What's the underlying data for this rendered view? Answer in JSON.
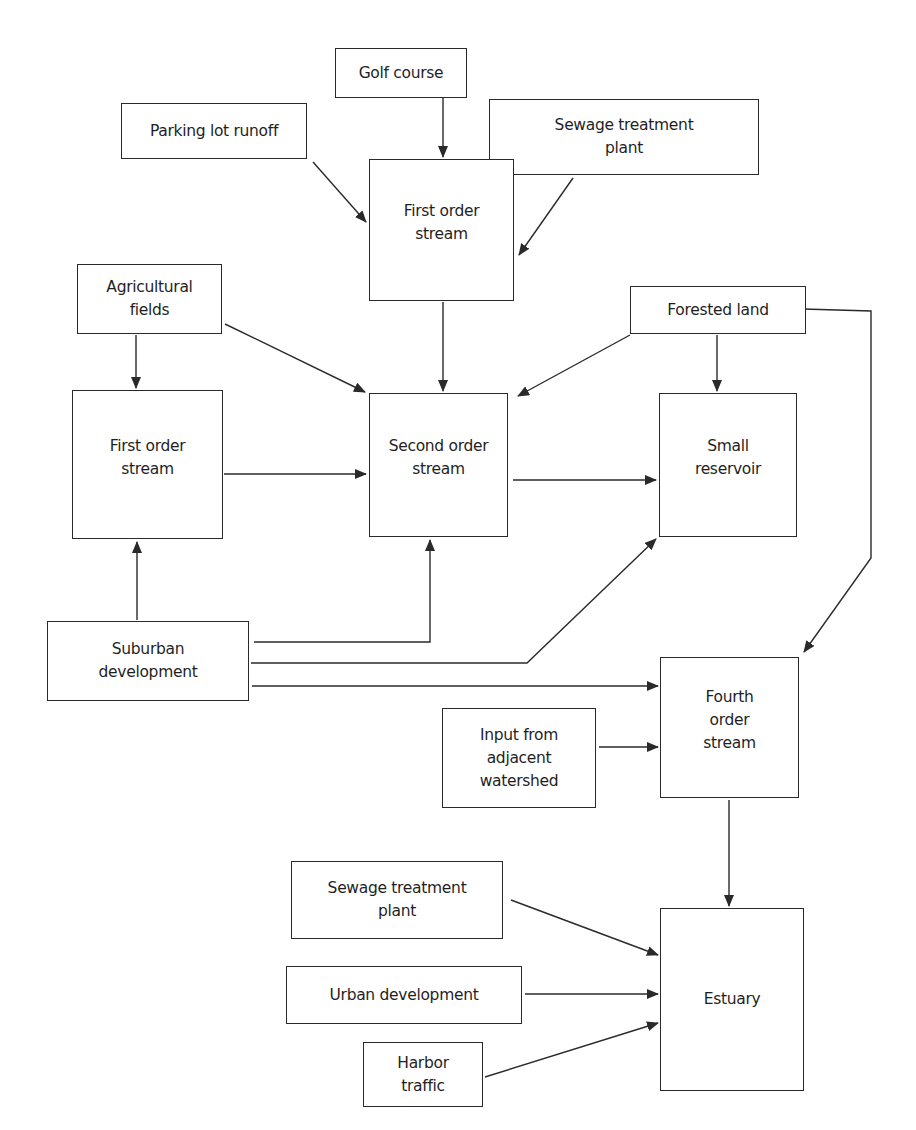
{
  "diagram": {
    "type": "flowchart",
    "nodes": {
      "golf_course": "Golf course",
      "parking_lot_runoff": "Parking lot runoff",
      "sewage_plant_top": "Sewage treatment\nplant",
      "first_order_stream_top": "First order\nstream",
      "agricultural_fields": "Agricultural\nfields",
      "forested_land": "Forested land",
      "first_order_stream_left": "First order\nstream",
      "second_order_stream": "Second order\nstream",
      "small_reservoir": "Small\nreservoir",
      "suburban_development": "Suburban\ndevelopment",
      "fourth_order_stream": "Fourth\norder\nstream",
      "input_adjacent_watershed": "Input from\nadjacent\nwatershed",
      "sewage_plant_bottom": "Sewage treatment\nplant",
      "urban_development": "Urban development",
      "harbor_traffic": "Harbor\ntraffic",
      "estuary": "Estuary"
    },
    "edges": [
      {
        "from": "Golf course",
        "to": "First order stream (top)"
      },
      {
        "from": "Parking lot runoff",
        "to": "First order stream (top)"
      },
      {
        "from": "Sewage treatment plant (top)",
        "to": "First order stream (top)"
      },
      {
        "from": "First order stream (top)",
        "to": "Second order stream"
      },
      {
        "from": "Agricultural fields",
        "to": "First order stream (left)"
      },
      {
        "from": "Agricultural fields",
        "to": "Second order stream"
      },
      {
        "from": "Forested land",
        "to": "Second order stream"
      },
      {
        "from": "Forested land",
        "to": "Small reservoir"
      },
      {
        "from": "Forested land",
        "to": "Fourth order stream"
      },
      {
        "from": "First order stream (left)",
        "to": "Second order stream"
      },
      {
        "from": "Second order stream",
        "to": "Small reservoir"
      },
      {
        "from": "Suburban development",
        "to": "First order stream (left)"
      },
      {
        "from": "Suburban development",
        "to": "Second order stream"
      },
      {
        "from": "Suburban development",
        "to": "Small reservoir"
      },
      {
        "from": "Suburban development",
        "to": "Fourth order stream"
      },
      {
        "from": "Input from adjacent watershed",
        "to": "Fourth order stream"
      },
      {
        "from": "Fourth order stream",
        "to": "Estuary"
      },
      {
        "from": "Sewage treatment plant (bottom)",
        "to": "Estuary"
      },
      {
        "from": "Urban development",
        "to": "Estuary"
      },
      {
        "from": "Harbor traffic",
        "to": "Estuary"
      }
    ]
  }
}
